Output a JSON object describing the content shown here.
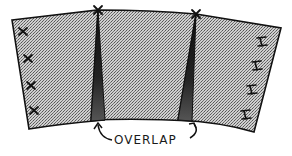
{
  "diagram": {
    "label_overlap": "OVERLAP",
    "colors": {
      "panel_fill": "#b8b8b8",
      "overlap_fill": "#2a2a2a",
      "stroke": "#111111",
      "background": "#ffffff"
    },
    "panels": [
      {
        "name": "left-panel",
        "marks": "x",
        "mark_count": 4
      },
      {
        "name": "center-panel",
        "marks": "none",
        "mark_count": 0
      },
      {
        "name": "right-panel",
        "marks": "I",
        "mark_count": 4
      }
    ],
    "overlaps": [
      {
        "name": "left-overlap"
      },
      {
        "name": "right-overlap"
      }
    ],
    "seam_marks": [
      "x",
      "x"
    ]
  }
}
